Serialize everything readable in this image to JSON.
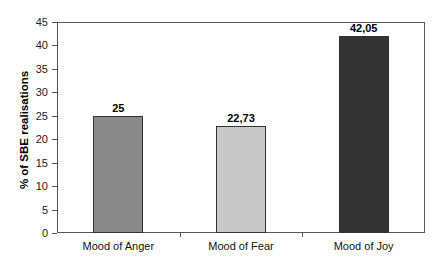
{
  "chart_data": {
    "type": "bar",
    "title": "",
    "xlabel": "",
    "ylabel": "% of SBE realisations",
    "ylim": [
      0,
      45
    ],
    "yticks": [
      0,
      5,
      10,
      15,
      20,
      25,
      30,
      35,
      40,
      45
    ],
    "categories": [
      "Mood of Anger",
      "Mood of Fear",
      "Mood of Joy"
    ],
    "values": [
      25,
      22.73,
      42.05
    ],
    "value_labels": [
      "25",
      "22,73",
      "42,05"
    ],
    "bar_colors": [
      "#8a8a8a",
      "#c8c8c8",
      "#333333"
    ],
    "grid": false,
    "legend": null
  },
  "axis": {
    "y_title": "% of SBE realisations",
    "y_ticks": [
      "0",
      "5",
      "10",
      "15",
      "20",
      "25",
      "30",
      "35",
      "40",
      "45"
    ]
  },
  "bars": [
    {
      "label": "Mood of Anger",
      "value_label": "25",
      "value": 25,
      "color": "#8a8a8a"
    },
    {
      "label": "Mood of Fear",
      "value_label": "22,73",
      "value": 22.73,
      "color": "#c8c8c8"
    },
    {
      "label": "Mood of Joy",
      "value_label": "42,05",
      "value": 42.05,
      "color": "#333333"
    }
  ]
}
